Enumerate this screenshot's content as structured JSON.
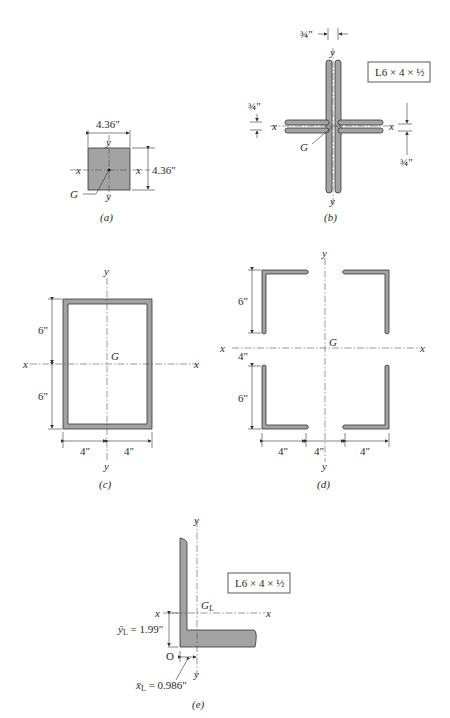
{
  "figure": {
    "panels": [
      {
        "id": "a",
        "caption": "(a)",
        "width_label": "4.36\"",
        "height_label": "4.36\"",
        "x_axis": "x",
        "y_axis": "y",
        "centroid": "G"
      },
      {
        "id": "b",
        "caption": "(b)",
        "section_label": "L6 × 4 × ½",
        "thickness_top": "¾\"",
        "thickness_left": "¾\"",
        "thickness_right": "¾\"",
        "x_axis": "x",
        "y_axis": "y",
        "centroid": "G"
      },
      {
        "id": "c",
        "caption": "(c)",
        "upper_height": "6\"",
        "lower_height": "6\"",
        "left_width": "4\"",
        "right_width": "4\"",
        "x_axis": "x",
        "y_axis": "y",
        "centroid": "G"
      },
      {
        "id": "d",
        "caption": "(d)",
        "upper_height": "6\"",
        "gap_height": "4\"",
        "lower_height": "6\"",
        "left_width": "4\"",
        "gap_width": "4\"",
        "right_width": "4\"",
        "x_axis": "x",
        "y_axis": "y",
        "centroid": "G"
      },
      {
        "id": "e",
        "caption": "(e)",
        "section_label": "L6 × 4 × ½",
        "centroid": "G",
        "centroid_sub": "L",
        "origin": "O",
        "ybar_label": "ȳ",
        "ybar_sub": "L",
        "ybar_value": " = 1.99\"",
        "xbar_label": "x̄",
        "xbar_sub": "L",
        "xbar_value": " = 0.986\"",
        "x_axis": "x",
        "y_axis": "y"
      }
    ]
  }
}
